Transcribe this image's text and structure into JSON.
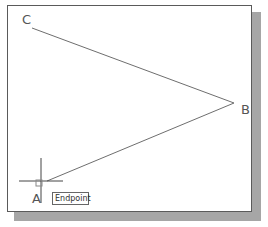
{
  "drawing": {
    "points": [
      {
        "id": "C",
        "label": "C",
        "x": 32,
        "y": 28
      },
      {
        "id": "B",
        "label": "B",
        "x": 234,
        "y": 103
      },
      {
        "id": "A",
        "label": "A",
        "x": 47,
        "y": 181
      }
    ],
    "lines": [
      {
        "from": "C",
        "to": "B"
      },
      {
        "from": "B",
        "to": "A"
      }
    ],
    "line_color": "#6e6e6e"
  },
  "cursor": {
    "type": "crosshair",
    "center_x": 41,
    "center_y": 181,
    "pickbox": true
  },
  "osnap_tooltip": {
    "label": "Endpoint"
  },
  "labels": {
    "C": "C",
    "B": "B",
    "A": "A"
  }
}
